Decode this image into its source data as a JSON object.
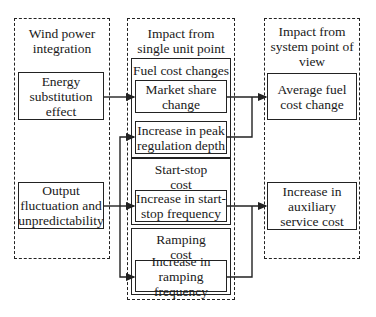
{
  "columns": {
    "left": {
      "title": "Wind power integration",
      "boxes": [
        "Energy substitution effect",
        "Output fluctuation and unpredictability"
      ]
    },
    "middle": {
      "title": "Impact from single unit point of view",
      "groups": [
        {
          "title": "Fuel cost changes",
          "items": [
            "Market share change",
            "Increase in peak regulation depth"
          ]
        },
        {
          "title": "Start-stop cost Increase",
          "items": [
            "Increase in start-stop frequency"
          ]
        },
        {
          "title": "Ramping cost Increase",
          "items": [
            "Increase in ramping frequency"
          ]
        }
      ]
    },
    "right": {
      "title": "Impact from system point of view",
      "boxes": [
        "Average fuel cost change",
        "Increase in auxiliary service cost"
      ]
    }
  },
  "style": {
    "line_color": "#222222",
    "background": "#ffffff"
  }
}
